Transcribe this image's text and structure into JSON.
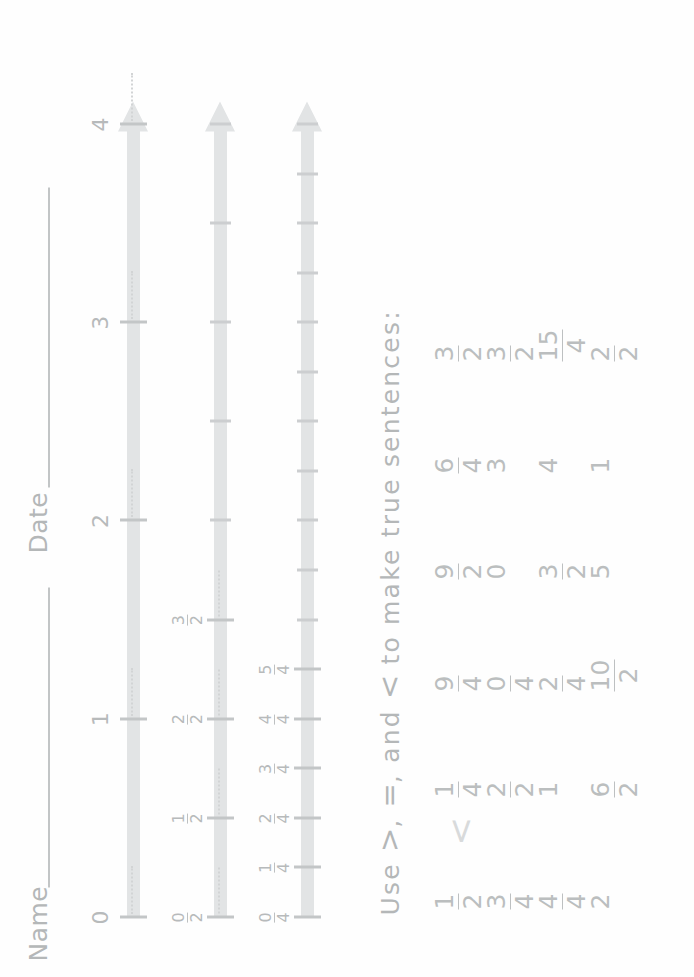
{
  "sheet": {
    "orientation_note_hidden": true,
    "ink_color": "#b9bcbd",
    "bar_color": "#e2e4e5"
  },
  "header": {
    "name_label": "Name",
    "date_label": "Date"
  },
  "numberlines": [
    {
      "id": "wholes",
      "max": 4,
      "labels": [
        "0",
        "1",
        "2",
        "3",
        "4"
      ],
      "values": [
        0,
        1,
        2,
        3,
        4
      ]
    },
    {
      "id": "halves",
      "max": 4,
      "labels": [
        "0/2",
        "1/2",
        "2/2",
        "3/2"
      ],
      "numerators": [
        "0",
        "1",
        "2",
        "3"
      ],
      "denominators": [
        "2",
        "2",
        "2",
        "2"
      ],
      "values": [
        0,
        0.5,
        1,
        1.5
      ],
      "unlabeled_values": [
        2,
        2.5,
        3,
        3.5,
        4
      ]
    },
    {
      "id": "fourths",
      "max": 4,
      "labels": [
        "0/4",
        "1/4",
        "2/4",
        "3/4",
        "4/4",
        "5/4"
      ],
      "numerators": [
        "0",
        "1",
        "2",
        "3",
        "4",
        "5"
      ],
      "denominators": [
        "4",
        "4",
        "4",
        "4",
        "4",
        "4"
      ],
      "values": [
        0,
        0.25,
        0.5,
        0.75,
        1,
        1.25
      ],
      "unlabeled_values": [
        1.5,
        1.75,
        2,
        2.25,
        2.5,
        2.75,
        3,
        3.25,
        3.5,
        3.75,
        4
      ]
    }
  ],
  "instruction": {
    "prefix": "Use ",
    "sym_gt": ">",
    "sep1": ", ",
    "sym_eq": "=",
    "sep2": ", and ",
    "sym_lt": "<",
    "suffix": " to make true sentences:",
    "full": "Use >, =, and < to make true sentences:"
  },
  "exercises": {
    "columns": 4,
    "rows": 4,
    "items": [
      {
        "left": "1/2",
        "left_num": "1",
        "left_den": "2",
        "right": "1/4",
        "right_num": "1",
        "right_den": "4",
        "answer_trace": "<"
      },
      {
        "left": "3/4",
        "left_num": "3",
        "left_den": "4",
        "right": "2/2",
        "right_num": "2",
        "right_den": "2",
        "answer_trace": ""
      },
      {
        "left": "4/4",
        "left_num": "4",
        "left_den": "4",
        "right": "1",
        "right_num": "",
        "right_den": "",
        "answer_trace": ""
      },
      {
        "left": "2",
        "left_num": "",
        "left_den": "",
        "right": "6/2",
        "right_num": "6",
        "right_den": "2",
        "answer_trace": ""
      },
      {
        "left": "9/4",
        "left_num": "9",
        "left_den": "4",
        "right": "9/2",
        "right_num": "9",
        "right_den": "2",
        "answer_trace": ""
      },
      {
        "left": "0/4",
        "left_num": "0",
        "left_den": "4",
        "right": "0",
        "right_num": "",
        "right_den": "",
        "answer_trace": ""
      },
      {
        "left": "2/4",
        "left_num": "2",
        "left_den": "4",
        "right": "3/2",
        "right_num": "3",
        "right_den": "2",
        "answer_trace": ""
      },
      {
        "left": "10/2",
        "left_num": "10",
        "left_den": "2",
        "right": "5",
        "right_num": "",
        "right_den": "",
        "answer_trace": ""
      },
      {
        "left": "6/4",
        "left_num": "6",
        "left_den": "4",
        "right": "3/2",
        "right_num": "3",
        "right_den": "2",
        "answer_trace": ""
      },
      {
        "left": "3",
        "left_num": "",
        "left_den": "",
        "right": "3/2",
        "right_num": "3",
        "right_den": "2",
        "answer_trace": ""
      },
      {
        "left": "4",
        "left_num": "",
        "left_den": "",
        "right": "15/4",
        "right_num": "15",
        "right_den": "4",
        "answer_trace": ""
      },
      {
        "left": "1",
        "left_num": "",
        "left_den": "",
        "right": "2/2",
        "right_num": "2",
        "right_den": "2",
        "answer_trace": ""
      }
    ]
  },
  "footer": {
    "text": ""
  }
}
